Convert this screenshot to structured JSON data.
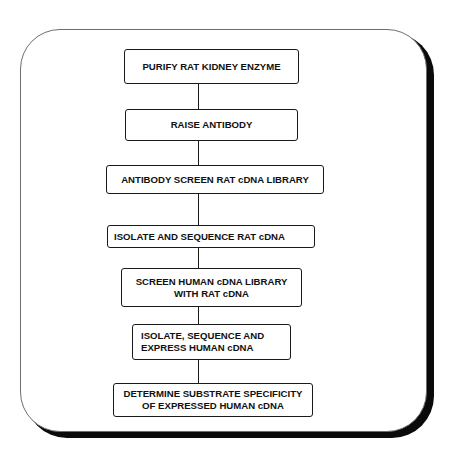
{
  "diagram": {
    "type": "flowchart",
    "direction": "top-to-bottom",
    "steps": [
      {
        "id": "step-1",
        "label": "PURIFY RAT KIDNEY ENZYME"
      },
      {
        "id": "step-2",
        "label": "RAISE ANTIBODY"
      },
      {
        "id": "step-3",
        "label": "ANTIBODY SCREEN RAT cDNA LIBRARY"
      },
      {
        "id": "step-4",
        "label": "ISOLATE AND SEQUENCE RAT cDNA"
      },
      {
        "id": "step-5",
        "label": "SCREEN HUMAN cDNA LIBRARY\nWITH RAT cDNA"
      },
      {
        "id": "step-6",
        "label": "ISOLATE, SEQUENCE AND\nEXPRESS HUMAN cDNA"
      },
      {
        "id": "step-7",
        "label": "DETERMINE SUBSTRATE SPECIFICITY\nOF EXPRESSED HUMAN cDNA"
      }
    ],
    "edges": [
      {
        "from": "step-1",
        "to": "step-2"
      },
      {
        "from": "step-2",
        "to": "step-3"
      },
      {
        "from": "step-3",
        "to": "step-4"
      },
      {
        "from": "step-4",
        "to": "step-5"
      },
      {
        "from": "step-5",
        "to": "step-6"
      },
      {
        "from": "step-6",
        "to": "step-7"
      }
    ]
  },
  "colors": {
    "background": "#ffffff",
    "stroke": "#1a1a1a",
    "shadow": "#0a0a0a",
    "text": "#111111"
  }
}
